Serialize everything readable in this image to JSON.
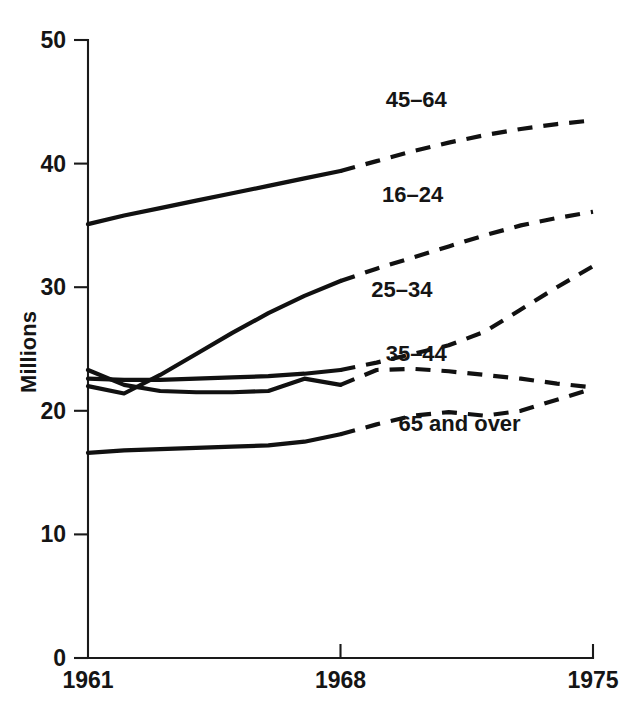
{
  "chart_data": {
    "type": "line",
    "title": "",
    "subtitle": "",
    "xlabel": "",
    "ylabel": "Millions",
    "xlim": [
      1961,
      1975
    ],
    "ylim": [
      0,
      50
    ],
    "x_ticks": [
      1961,
      1968,
      1975
    ],
    "x_tick_labels": [
      "1961",
      "1968",
      "1975"
    ],
    "y_ticks": [
      0,
      10,
      20,
      30,
      40,
      50
    ],
    "y_tick_labels": [
      "0",
      "10",
      "20",
      "30",
      "40",
      "50"
    ],
    "grid": false,
    "legend_position": "inline-labels",
    "note": "Solid segments are actual data (1961-1968); dashed segments are projections (1968-1975).",
    "series": [
      {
        "name": "45-64",
        "label": "45–64",
        "label_x": 1970.1,
        "label_y": 44.6,
        "line_style": "solid-then-dashed",
        "solid_break_x": 1968,
        "x": [
          1961,
          1962,
          1963,
          1964,
          1965,
          1966,
          1967,
          1968,
          1969,
          1970,
          1971,
          1972,
          1973,
          1974,
          1975
        ],
        "values": [
          35.1,
          35.8,
          36.4,
          37.0,
          37.6,
          38.2,
          38.8,
          39.4,
          40.2,
          41.0,
          41.7,
          42.3,
          42.8,
          43.2,
          43.5
        ]
      },
      {
        "name": "16-24",
        "label": "16–24",
        "label_x": 1970.0,
        "label_y": 36.9,
        "line_style": "solid-then-dashed",
        "solid_break_x": 1968,
        "x": [
          1961,
          1962,
          1963,
          1964,
          1965,
          1966,
          1967,
          1968,
          1969,
          1970,
          1971,
          1972,
          1973,
          1974,
          1975
        ],
        "values": [
          22.0,
          21.4,
          22.9,
          24.6,
          26.3,
          27.9,
          29.3,
          30.5,
          31.5,
          32.4,
          33.3,
          34.2,
          35.0,
          35.6,
          36.1
        ]
      },
      {
        "name": "25-34",
        "label": "25–34",
        "label_x": 1969.7,
        "label_y": 29.2,
        "line_style": "solid-then-dashed",
        "solid_break_x": 1968,
        "x": [
          1961,
          1962,
          1963,
          1964,
          1965,
          1966,
          1967,
          1968,
          1969,
          1970,
          1971,
          1972,
          1973,
          1974,
          1975
        ],
        "values": [
          22.6,
          22.5,
          22.5,
          22.6,
          22.7,
          22.8,
          23.0,
          23.3,
          23.9,
          24.6,
          25.3,
          26.4,
          28.2,
          30.0,
          31.7
        ]
      },
      {
        "name": "35-44",
        "label": "35–44",
        "label_x": 1970.1,
        "label_y": 24.0,
        "line_style": "solid-then-dashed",
        "solid_break_x": 1968,
        "x": [
          1961,
          1962,
          1963,
          1964,
          1965,
          1966,
          1967,
          1968,
          1969,
          1970,
          1971,
          1972,
          1973,
          1974,
          1975
        ],
        "values": [
          23.3,
          22.1,
          21.6,
          21.5,
          21.5,
          21.6,
          22.6,
          22.1,
          23.3,
          23.4,
          23.2,
          22.9,
          22.6,
          22.2,
          21.9
        ]
      },
      {
        "name": "65 and over",
        "label": "65 and over",
        "label_x": 1971.3,
        "label_y": 18.4,
        "line_style": "solid-then-dashed",
        "solid_break_x": 1968,
        "x": [
          1961,
          1962,
          1963,
          1964,
          1965,
          1966,
          1967,
          1968,
          1969,
          1970,
          1971,
          1972,
          1973,
          1974,
          1975
        ],
        "values": [
          16.6,
          16.8,
          16.9,
          17.0,
          17.1,
          17.2,
          17.5,
          18.1,
          18.9,
          19.6,
          19.9,
          19.6,
          20.0,
          20.9,
          21.8
        ]
      }
    ]
  }
}
